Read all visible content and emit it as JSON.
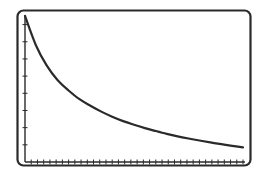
{
  "chart_data": {
    "type": "line",
    "title": "",
    "xlabel": "",
    "ylabel": "",
    "xlim": [
      0,
      1
    ],
    "ylim": [
      0,
      1
    ],
    "grid": false,
    "legend": null,
    "x_tick_count": 35,
    "y_tick_count": 8,
    "tick_labels": false,
    "series": [
      {
        "name": "decay-curve",
        "color": "#2a2a2a",
        "x": [
          0.0,
          0.05,
          0.1,
          0.15,
          0.2,
          0.25,
          0.3,
          0.35,
          0.4,
          0.45,
          0.5,
          0.55,
          0.6,
          0.65,
          0.7,
          0.75,
          0.8,
          0.85,
          0.9,
          0.95,
          1.0
        ],
        "y": [
          1.0,
          0.8,
          0.66,
          0.56,
          0.49,
          0.43,
          0.385,
          0.345,
          0.31,
          0.28,
          0.255,
          0.232,
          0.212,
          0.193,
          0.176,
          0.161,
          0.147,
          0.134,
          0.122,
          0.111,
          0.1
        ]
      }
    ]
  },
  "frame": {
    "stroke_color": "#2a2a2a",
    "background": "#ffffff",
    "corner_radius": 6
  }
}
